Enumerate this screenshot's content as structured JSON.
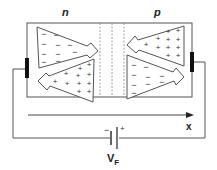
{
  "diagram": {
    "regions": [
      {
        "id": "n-region",
        "label": "n"
      },
      {
        "id": "p-region",
        "label": "p"
      }
    ],
    "n_triangle_top": {
      "carrier": "electrons",
      "sign": "−",
      "direction": "right"
    },
    "n_triangle_bottom": {
      "carrier": "holes",
      "sign": "+",
      "direction": "left"
    },
    "p_triangle_top": {
      "carrier": "holes",
      "sign": "+",
      "direction": "left"
    },
    "p_triangle_bottom": {
      "carrier": "electrons",
      "sign": "−",
      "direction": "right"
    },
    "axis": {
      "label": "x"
    },
    "battery": {
      "label_main": "V",
      "label_sub": "F",
      "minus": "−",
      "plus": "+"
    },
    "colors": {
      "line": "#555555",
      "contact": "#111111",
      "dashed": "#888888"
    }
  }
}
